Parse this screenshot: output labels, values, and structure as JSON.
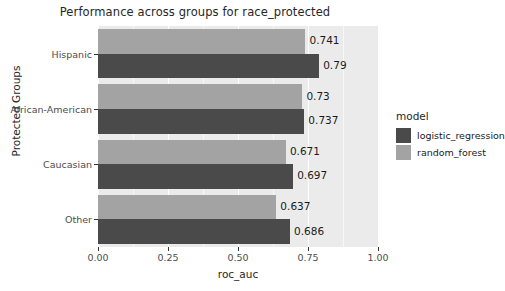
{
  "chart_data": {
    "type": "bar",
    "orientation": "horizontal",
    "title": "Performance across groups for race_protected",
    "xlabel": "roc_auc",
    "ylabel": "Protected Groups",
    "categories": [
      "Hispanic",
      "African-American",
      "Caucasian",
      "Other"
    ],
    "series": [
      {
        "name": "logistic_regression",
        "color": "#4a4a4a",
        "values": [
          0.79,
          0.737,
          0.697,
          0.686
        ],
        "labels": [
          "0.79",
          "0.737",
          "0.697",
          "0.686"
        ]
      },
      {
        "name": "random_forest",
        "color": "#a3a3a3",
        "values": [
          0.741,
          0.73,
          0.671,
          0.637
        ],
        "labels": [
          "0.741",
          "0.73",
          "0.671",
          "0.637"
        ]
      }
    ],
    "xlim": [
      0.0,
      1.0
    ],
    "xticks": [
      0.0,
      0.25,
      0.5,
      0.75,
      1.0
    ],
    "xticklabels": [
      "0.00",
      "0.25",
      "0.50",
      "0.75",
      "1.00"
    ],
    "grid": true,
    "grid_color": "#ffffff",
    "panel_background": "#ebebeb",
    "legend_position": "right",
    "legend_title": "model"
  },
  "legend": {
    "title": "model",
    "entries": [
      {
        "label": "logistic_regression",
        "color": "#4a4a4a"
      },
      {
        "label": "random_forest",
        "color": "#a3a3a3"
      }
    ]
  },
  "axes": {
    "x_title": "roc_auc",
    "y_title": "Protected Groups",
    "x_tick_labels": [
      "0.00",
      "0.25",
      "0.50",
      "0.75",
      "1.00"
    ],
    "y_tick_labels": [
      "Hispanic",
      "African-American",
      "Caucasian",
      "Other"
    ]
  },
  "title": "Performance across groups for race_protected"
}
